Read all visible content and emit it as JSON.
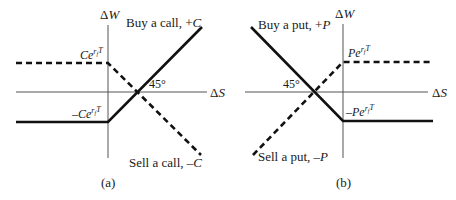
{
  "figure": {
    "panels": [
      {
        "id": "a",
        "caption": "(a)",
        "y_axis_label": "ΔW",
        "x_axis_label": "ΔS",
        "angle_label": "45°",
        "lines": [
          {
            "name": "Buy a call, +C",
            "style": "solid",
            "label": "Buy a call, +C"
          },
          {
            "name": "Sell a call, −C",
            "style": "dashed",
            "label": "Sell a call, −C"
          }
        ],
        "level_labels": {
          "upper": {
            "base": "Ce",
            "sup": "r",
            "sub": "f",
            "sup2": "T"
          },
          "lower": {
            "base": "−Ce",
            "sup": "r",
            "sub": "f",
            "sup2": "T"
          }
        }
      },
      {
        "id": "b",
        "caption": "(b)",
        "y_axis_label": "ΔW",
        "x_axis_label": "ΔS",
        "angle_label": "45°",
        "lines": [
          {
            "name": "Buy a put, +P",
            "style": "solid",
            "label": "Buy a put, +P"
          },
          {
            "name": "Sell a put, −P",
            "style": "dashed",
            "label": "Sell a put, −P"
          }
        ],
        "level_labels": {
          "upper": {
            "base": "Pe",
            "sup": "r",
            "sub": "f",
            "sup2": "T"
          },
          "lower": {
            "base": "−Pe",
            "sup": "r",
            "sub": "f",
            "sup2": "T"
          }
        }
      }
    ]
  },
  "text": {
    "a_buy_prefix": "Buy a call, +",
    "a_buy_var": "C",
    "a_sell_prefix": "Sell a call, –",
    "a_sell_var": "C",
    "b_buy_prefix": "Buy a put, +",
    "b_buy_var": "P",
    "b_sell_prefix": "Sell a put, –",
    "b_sell_var": "P",
    "dw": "Δ",
    "w": "W",
    "ds": "Δ",
    "s": "S",
    "angle": "45°",
    "cap_a": "(a)",
    "cap_b": "(b)",
    "a_upper_base": "Ce",
    "a_lower_base": "–Ce",
    "b_upper_base": "Pe",
    "b_lower_base": "–Pe",
    "exp_r": "r",
    "exp_f": "f",
    "exp_T": "T"
  }
}
